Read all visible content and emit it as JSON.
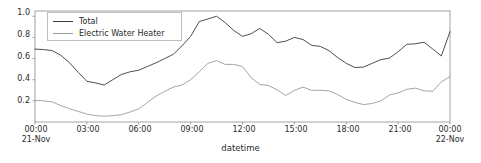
{
  "chart_data": {
    "type": "line",
    "title": "",
    "xlabel": "datetime",
    "ylabel": "",
    "grid": false,
    "legend_position": "upper-left",
    "xlim": [
      0,
      24
    ],
    "ylim": [
      0.0,
      1.05
    ],
    "yticks": [
      "0.2",
      "0.4",
      "0.6",
      "0.8",
      "1.0"
    ],
    "ytick_values": [
      0.2,
      0.4,
      0.6,
      0.8,
      1.0
    ],
    "xticks": [
      {
        "label": "00:00",
        "sublabel": "21-Nov",
        "value": 0
      },
      {
        "label": "03:00",
        "sublabel": "",
        "value": 3
      },
      {
        "label": "06:00",
        "sublabel": "",
        "value": 6
      },
      {
        "label": "09:00",
        "sublabel": "",
        "value": 9
      },
      {
        "label": "12:00",
        "sublabel": "",
        "value": 12
      },
      {
        "label": "15:00",
        "sublabel": "",
        "value": 15
      },
      {
        "label": "18:00",
        "sublabel": "",
        "value": 18
      },
      {
        "label": "21:00",
        "sublabel": "",
        "value": 21
      },
      {
        "label": "00:00",
        "sublabel": "22-Nov",
        "value": 24
      }
    ],
    "x": [
      0,
      0.5,
      1,
      1.5,
      2,
      2.5,
      3,
      3.5,
      4,
      4.5,
      5,
      5.5,
      6,
      6.5,
      7,
      7.5,
      8,
      8.5,
      9,
      9.5,
      10,
      10.5,
      11,
      11.5,
      12,
      12.5,
      13,
      13.5,
      14,
      14.5,
      15,
      15.5,
      16,
      16.5,
      17,
      17.5,
      18,
      18.5,
      19,
      19.5,
      20,
      20.5,
      21,
      21.5,
      22,
      22.5,
      23,
      23.5,
      24
    ],
    "series": [
      {
        "name": "Total",
        "color": "#3b3b3b",
        "values": [
          0.69,
          0.685,
          0.675,
          0.63,
          0.56,
          0.47,
          0.385,
          0.37,
          0.35,
          0.4,
          0.45,
          0.475,
          0.49,
          0.525,
          0.56,
          0.6,
          0.64,
          0.72,
          0.81,
          0.95,
          0.975,
          1.0,
          0.94,
          0.865,
          0.81,
          0.835,
          0.885,
          0.83,
          0.75,
          0.765,
          0.8,
          0.78,
          0.725,
          0.715,
          0.675,
          0.61,
          0.555,
          0.515,
          0.52,
          0.555,
          0.59,
          0.605,
          0.665,
          0.735,
          0.74,
          0.755,
          0.69,
          0.625,
          0.855
        ],
        "annotations": [
          {
            "label": "peak",
            "x": 22.6,
            "y": 1.02
          }
        ]
      },
      {
        "name": "Electric Water Heater",
        "color": "#9a9a9a",
        "values": [
          0.205,
          0.2,
          0.19,
          0.155,
          0.125,
          0.1,
          0.075,
          0.06,
          0.055,
          0.06,
          0.07,
          0.095,
          0.125,
          0.185,
          0.245,
          0.29,
          0.33,
          0.35,
          0.4,
          0.475,
          0.555,
          0.58,
          0.545,
          0.545,
          0.525,
          0.42,
          0.355,
          0.345,
          0.305,
          0.25,
          0.3,
          0.33,
          0.3,
          0.3,
          0.295,
          0.26,
          0.215,
          0.185,
          0.165,
          0.175,
          0.2,
          0.255,
          0.275,
          0.31,
          0.32,
          0.295,
          0.29,
          0.38,
          0.43
        ]
      }
    ]
  },
  "legend": {
    "entries": [
      {
        "label": "Total",
        "color": "#3b3b3b"
      },
      {
        "label": "Electric Water Heater",
        "color": "#9a9a9a"
      }
    ]
  },
  "axes": {
    "xlabel": "datetime",
    "spine_color": "#8c8c8c"
  }
}
